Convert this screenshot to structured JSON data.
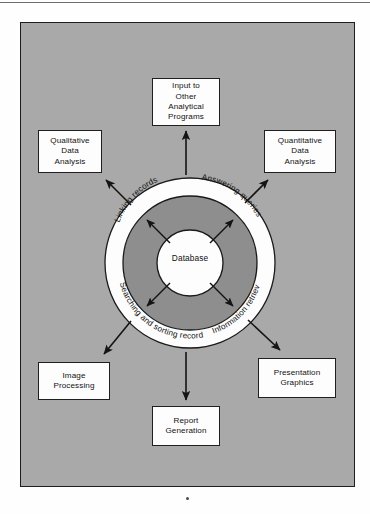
{
  "figure": {
    "type": "concentric-ring-diagram",
    "frame": {
      "background_color": "#a9a9a9",
      "border_color": "#1d1d1d"
    },
    "core": {
      "label": "Database",
      "fill_color": "#ffffff"
    },
    "inner_annulus": {
      "fill_color": "#8e8e8e"
    },
    "outer_ring": {
      "fill_color": "#ffffff",
      "labels": [
        {
          "id": "linking-records",
          "text": "Linking records",
          "position": "upper-left"
        },
        {
          "id": "answering-queries",
          "text": "Answering queries",
          "position": "upper-right"
        },
        {
          "id": "searching-and-sorting-records",
          "text": "Searching and sorting records",
          "position": "lower-left"
        },
        {
          "id": "information-retrieval",
          "text": "Information retrieval",
          "position": "lower-right"
        }
      ]
    },
    "boxes": [
      {
        "id": "input-to-other",
        "text": "Input to\nOther\nAnalytical\nPrograms",
        "position": "top"
      },
      {
        "id": "qualitative",
        "text": "Qualitative\nData\nAnalysis",
        "position": "upper-left"
      },
      {
        "id": "quantitative",
        "text": "Quantitative\nData\nAnalysis",
        "position": "upper-right"
      },
      {
        "id": "image-processing",
        "text": "Image\nProcessing",
        "position": "lower-left"
      },
      {
        "id": "presentation-graphics",
        "text": "Presentation\nGraphics",
        "position": "lower-right"
      },
      {
        "id": "report-generation",
        "text": "Report\nGeneration",
        "position": "bottom"
      }
    ],
    "arrows": {
      "inner_count": 4,
      "inner_direction": "bidirectional-radial",
      "outer_count": 6,
      "outer_direction": "outward-to-boxes"
    }
  }
}
